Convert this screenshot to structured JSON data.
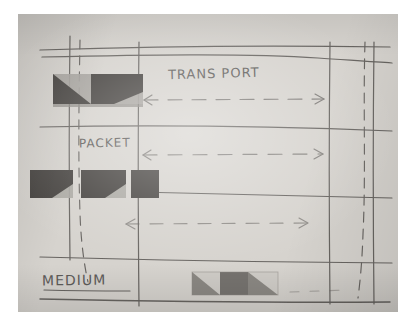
{
  "figure": {
    "kind": "hand-drawn-diagram",
    "medium": "pencil on paper, photographed",
    "paper_color": "#d6d3ce",
    "ink_color": "#55524f"
  },
  "labels": {
    "transport": "TRANS PORT",
    "packet": "PACKET",
    "medium": "MEDIUM"
  },
  "arrows": [
    {
      "name": "transport-span-arrow",
      "label": "TRANS PORT",
      "direction": "bidirectional",
      "style": "dashed"
    },
    {
      "name": "packet-span-arrow",
      "label": "PACKET",
      "direction": "bidirectional",
      "style": "dashed"
    },
    {
      "name": "unlabeled-span-arrow",
      "label": "",
      "direction": "bidirectional",
      "style": "dashed"
    }
  ],
  "blocks": {
    "top_row": {
      "name": "transport-layer-blocks",
      "fill_dark": "#4a4745",
      "fill_light": "#9d9a96",
      "segments": [
        {
          "shape": "diagonal-split",
          "dark_side": "lower-left"
        },
        {
          "shape": "diagonal-split",
          "dark_side": "upper-left"
        }
      ]
    },
    "middle_row": {
      "name": "packet-layer-blocks",
      "fill_dark": "#4a4745",
      "fill_light": "#a7a49f",
      "segments": [
        {
          "shape": "diagonal-split",
          "dark_side": "upper-left"
        },
        {
          "shape": "diagonal-split",
          "dark_side": "upper-left"
        },
        {
          "shape": "solid",
          "dark_side": "all"
        }
      ]
    },
    "bottom_row": {
      "name": "medium-layer-blocks",
      "fill_dark": "#7b7874",
      "fill_light": "#c2bfba",
      "segments": [
        {
          "shape": "diagonal-split",
          "dark_side": "lower-left"
        },
        {
          "shape": "solid",
          "dark_side": "all"
        },
        {
          "shape": "diagonal-split",
          "dark_side": "lower-left"
        }
      ]
    }
  },
  "guides": {
    "horizontal_rules": 6,
    "vertical_rules": 6,
    "dashed_verticals": 2
  }
}
